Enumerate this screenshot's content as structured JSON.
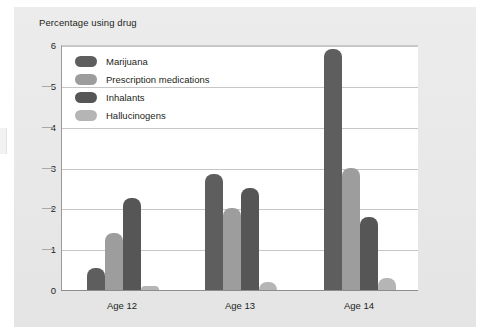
{
  "chart_data": {
    "type": "bar",
    "title": "Percentage using drug",
    "xlabel": "",
    "ylabel": "Percentage using drug",
    "ylim": [
      0,
      6
    ],
    "yticks": [
      0,
      1,
      2,
      3,
      4,
      5,
      6
    ],
    "grid": true,
    "legend_position": "inside-top-left",
    "categories": [
      "Age 12",
      "Age 13",
      "Age 14"
    ],
    "series": [
      {
        "name": "Marijuana",
        "color": "#5e5e5e",
        "values": [
          0.55,
          2.85,
          5.9
        ]
      },
      {
        "name": "Prescription medications",
        "color": "#9d9d9d",
        "values": [
          1.4,
          2.0,
          3.0
        ]
      },
      {
        "name": "Inhalants",
        "color": "#565656",
        "values": [
          2.25,
          2.5,
          1.8
        ]
      },
      {
        "name": "Hallucinogens",
        "color": "#b5b5b5",
        "values": [
          0.1,
          0.2,
          0.3
        ]
      }
    ]
  },
  "colors": {
    "panel_background": "#e9e9e9",
    "plot_background": "#ffffff",
    "gridline": "#c6c6c6",
    "axis": "#8d8d8d",
    "text": "#231f20"
  },
  "legend": {
    "items": [
      {
        "label": "Marijuana"
      },
      {
        "label": "Prescription medications"
      },
      {
        "label": "Inhalants"
      },
      {
        "label": "Hallucinogens"
      }
    ]
  },
  "axis": {
    "y_tick_labels": [
      "6",
      "5",
      "4",
      "3",
      "2",
      "1",
      "0"
    ],
    "x_tick_labels": [
      "Age 12",
      "Age 13",
      "Age 14"
    ]
  }
}
